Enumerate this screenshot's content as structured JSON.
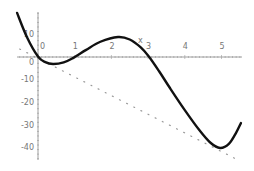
{
  "chart_data": {
    "type": "line",
    "title": "",
    "xlabel": "x",
    "ylabel": "",
    "xlim": [
      -0.57,
      5.55
    ],
    "ylim": [
      -46,
      19
    ],
    "grid": false,
    "legend": null,
    "x_ticks": [
      0,
      1,
      2,
      3,
      4,
      5
    ],
    "x_tick_labels": [
      "0",
      "1",
      "2",
      "3",
      "4",
      "5"
    ],
    "y_ticks": [
      10,
      0,
      -10,
      -20,
      -30,
      -40
    ],
    "y_tick_labels": [
      "10",
      "0",
      "-10",
      "-20",
      "-30",
      "-40"
    ],
    "series": [
      {
        "name": "curve",
        "style": "solid-thick",
        "color": "#111111",
        "x": [
          -0.57,
          -0.3,
          0,
          0.2,
          0.41,
          0.7,
          0.95,
          1.3,
          1.7,
          2.18,
          2.5,
          2.8,
          3.02,
          3.3,
          3.6,
          4.0,
          4.4,
          4.7,
          4.96,
          5.2,
          5.4,
          5.53
        ],
        "y": [
          19.2,
          8.5,
          0,
          -2.5,
          -3.3,
          -2.6,
          -0.7,
          2.8,
          6.5,
          8.6,
          7.5,
          4.0,
          0,
          -6.5,
          -14.0,
          -23.6,
          -32.5,
          -38.0,
          -40.3,
          -38.5,
          -33.5,
          -29.3
        ]
      },
      {
        "name": "tangent-line",
        "style": "dotted",
        "color": "#999999",
        "x": [
          -0.5,
          5.5
        ],
        "y": [
          3.3,
          -46
        ]
      }
    ],
    "annotations": [
      {
        "text": "x",
        "x": 2.75,
        "y": 7.5
      }
    ]
  }
}
